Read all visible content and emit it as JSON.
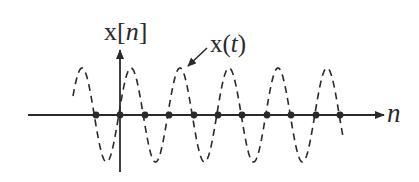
{
  "diagram": {
    "labels": {
      "y_axis": {
        "prefix": "x[",
        "var": "n",
        "suffix": "]"
      },
      "x_axis": "n",
      "curve": {
        "prefix": "x(",
        "var": "t",
        "suffix": ")"
      }
    },
    "colors": {
      "ink": "#2a2a2a",
      "background": "#ffffff"
    },
    "geometry": {
      "axis_y": 115,
      "axis_x_start": 28,
      "axis_x_end": 384,
      "v_axis_x": 120,
      "v_axis_top": 50,
      "v_axis_bottom": 172,
      "amplitude": 47,
      "period": 49,
      "curve_x_start": 73,
      "curve_x_end": 343,
      "peak_phase_x": 82
    },
    "samples": {
      "description": "Sample points lying on the n-axis (samples at zero crossings)",
      "x_positions": [
        96,
        120,
        145,
        169,
        194,
        218,
        242,
        267,
        291,
        316,
        340
      ]
    }
  }
}
